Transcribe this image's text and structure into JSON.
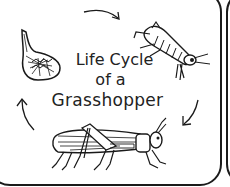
{
  "title": {
    "line1": "Life Cycle",
    "line2": "of a",
    "line3": "Grasshopper"
  },
  "stages": [
    {
      "name": "egg",
      "icon": "egg-pod-icon"
    },
    {
      "name": "nymph",
      "icon": "nymph-grasshopper-icon"
    },
    {
      "name": "adult",
      "icon": "adult-grasshopper-icon"
    }
  ],
  "arrows": [
    "arrow-egg-to-nymph",
    "arrow-nymph-to-adult",
    "arrow-adult-to-egg"
  ],
  "colors": {
    "ink": "#1a1a1a",
    "background": "#ffffff"
  }
}
